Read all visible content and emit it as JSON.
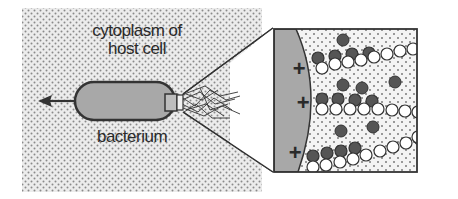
{
  "diagram": {
    "labels": {
      "cytoplasm_line1": "cytoplasm of",
      "cytoplasm_line2": "host cell",
      "bacterium": "bacterium",
      "plus": "+"
    },
    "colors": {
      "cytoplasm_bg": "#e6e6e6",
      "dots": "#8a8a8a",
      "bacterium_fill": "#a8a8a8",
      "outline": "#333333",
      "monomer_dark": "#555555",
      "monomer_light": "#ffffff"
    }
  }
}
